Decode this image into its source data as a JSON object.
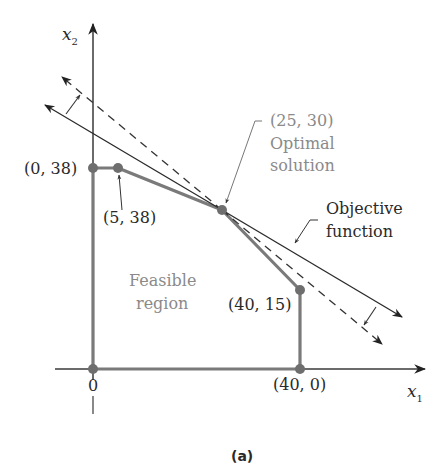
{
  "figure": {
    "caption": "(a)",
    "axes": {
      "x_label": "x",
      "x_sub": "1",
      "y_label": "x",
      "y_sub": "2",
      "origin_label": "0"
    },
    "vertices": [
      {
        "label": "(0, 38)",
        "x": 0,
        "y": 38
      },
      {
        "label": "(5, 38)",
        "x": 5,
        "y": 38
      },
      {
        "label": "(25, 30)",
        "x": 25,
        "y": 30
      },
      {
        "label": "(40, 15)",
        "x": 40,
        "y": 15
      },
      {
        "label": "(40, 0)",
        "x": 40,
        "y": 0
      }
    ],
    "annotations": {
      "optimal_point": "(25, 30)",
      "optimal_line1": "Optimal",
      "optimal_line2": "solution",
      "objective_line1": "Objective",
      "objective_line2": "function",
      "feasible_line1": "Feasible",
      "feasible_line2": "region"
    },
    "colors": {
      "region_edge": "#7a7a7a",
      "axes": "#3a3a3a",
      "objective_line": "#2a2a2a",
      "label_gray": "#8a8a8a",
      "label_dark": "#2a2a2a"
    }
  }
}
